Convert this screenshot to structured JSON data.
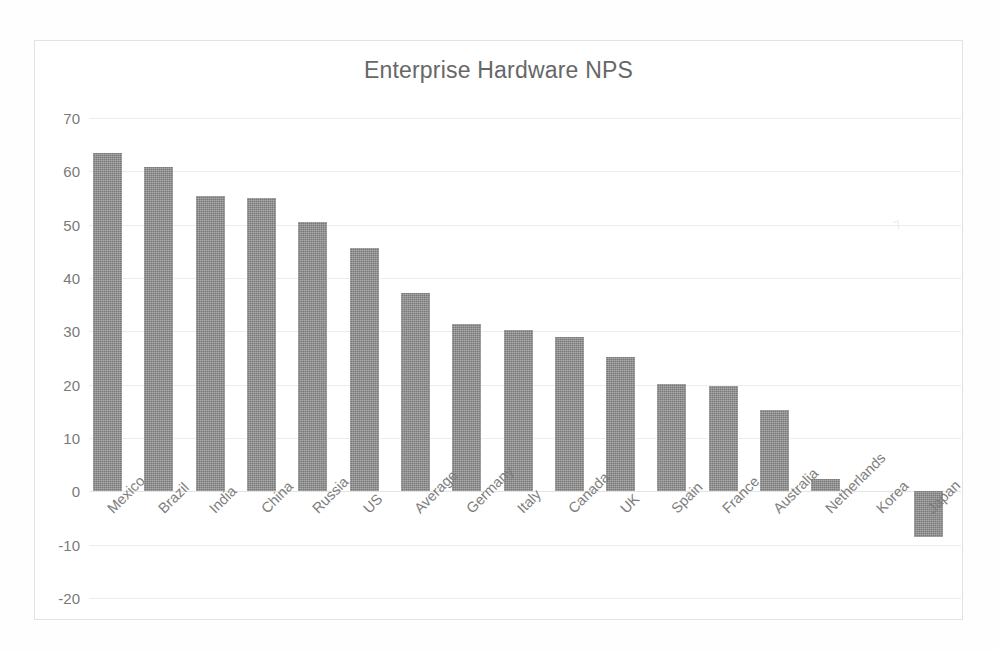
{
  "chart_data": {
    "type": "bar",
    "title": "Enterprise Hardware NPS",
    "xlabel": "",
    "ylabel": "",
    "ylim": [
      -20,
      70
    ],
    "ytick_step": 10,
    "yticks": [
      "70",
      "60",
      "50",
      "40",
      "30",
      "20",
      "10",
      "0",
      "-10",
      "-20"
    ],
    "grid": true,
    "legend": "none",
    "bar_color": "#787878",
    "categories": [
      "Mexico",
      "Brazil",
      "India",
      "China",
      "Russia",
      "US",
      "Average",
      "Germany",
      "Italy",
      "Canada",
      "UK",
      "Spain",
      "France",
      "Australia",
      "Netherlands",
      "Korea",
      "Japan"
    ],
    "values": [
      63.4,
      60.8,
      55.3,
      55.0,
      50.5,
      45.6,
      37.2,
      31.4,
      30.3,
      28.9,
      25.1,
      20.2,
      19.8,
      15.2,
      2.4,
      0.0,
      -8.5
    ]
  },
  "artifact": {
    "smudge_mark": "⁊"
  }
}
